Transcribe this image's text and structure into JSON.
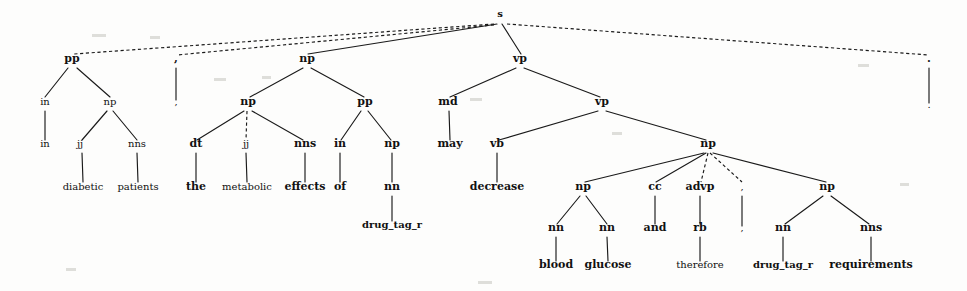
{
  "figure": {
    "name": "syntactic-parse-tree",
    "background_color": "#fdfdfc",
    "line_color": "#1a1a1a",
    "text_color": "#111111",
    "width": 967,
    "height": 291
  },
  "sentence": "in diabetic patients , the metabolic effects of drug_tag_r may decrease blood glucose and therefore , drug_tag_r requirements .",
  "nodes": [
    {
      "id": "s",
      "label": "s",
      "x": 500,
      "y": 17,
      "weight": "bold",
      "size": 10
    },
    {
      "id": "pp1",
      "label": "pp",
      "x": 72,
      "y": 62,
      "weight": "bold",
      "size": 11
    },
    {
      "id": "comma1",
      "label": ",",
      "x": 176,
      "y": 62,
      "weight": "bold",
      "size": 11
    },
    {
      "id": "np1",
      "label": "np",
      "x": 307,
      "y": 62,
      "weight": "bold",
      "size": 11
    },
    {
      "id": "vp1",
      "label": "vp",
      "x": 520,
      "y": 62,
      "weight": "bold",
      "size": 11
    },
    {
      "id": "period",
      "label": ".",
      "x": 929,
      "y": 62,
      "weight": "bold",
      "size": 11
    },
    {
      "id": "in1",
      "label": "in",
      "x": 45,
      "y": 105,
      "weight": "plain",
      "size": 10
    },
    {
      "id": "np2",
      "label": "np",
      "x": 110,
      "y": 105,
      "weight": "plain",
      "size": 10
    },
    {
      "id": "comma1t",
      "label": ",",
      "x": 176,
      "y": 105,
      "weight": "plain",
      "size": 10
    },
    {
      "id": "np3",
      "label": "np",
      "x": 248,
      "y": 105,
      "weight": "bold",
      "size": 11
    },
    {
      "id": "pp2",
      "label": "pp",
      "x": 365,
      "y": 105,
      "weight": "bold",
      "size": 11
    },
    {
      "id": "md",
      "label": "md",
      "x": 448,
      "y": 105,
      "weight": "bold",
      "size": 11
    },
    {
      "id": "vp2",
      "label": "vp",
      "x": 602,
      "y": 105,
      "weight": "bold",
      "size": 11
    },
    {
      "id": "periodt",
      "label": ".",
      "x": 929,
      "y": 108,
      "weight": "plain",
      "size": 10
    },
    {
      "id": "in1t",
      "label": "in",
      "x": 45,
      "y": 147,
      "weight": "plain",
      "size": 10
    },
    {
      "id": "jj1",
      "label": "jj",
      "x": 80,
      "y": 147,
      "weight": "plain",
      "size": 10
    },
    {
      "id": "nns1",
      "label": "nns",
      "x": 137,
      "y": 147,
      "weight": "plain",
      "size": 10
    },
    {
      "id": "dt",
      "label": "dt",
      "x": 196,
      "y": 147,
      "weight": "bold",
      "size": 11
    },
    {
      "id": "jj2",
      "label": "jj",
      "x": 246,
      "y": 147,
      "weight": "plain",
      "size": 10
    },
    {
      "id": "nns2",
      "label": "nns",
      "x": 305,
      "y": 147,
      "weight": "bold",
      "size": 11
    },
    {
      "id": "in2",
      "label": "in",
      "x": 340,
      "y": 147,
      "weight": "bold",
      "size": 11
    },
    {
      "id": "np4",
      "label": "np",
      "x": 392,
      "y": 147,
      "weight": "bold",
      "size": 11
    },
    {
      "id": "may",
      "label": "may",
      "x": 450,
      "y": 147,
      "weight": "bold",
      "size": 11
    },
    {
      "id": "vb",
      "label": "vb",
      "x": 497,
      "y": 147,
      "weight": "bold",
      "size": 11
    },
    {
      "id": "np5",
      "label": "np",
      "x": 708,
      "y": 147,
      "weight": "bold",
      "size": 11
    },
    {
      "id": "diabetic",
      "label": "diabetic",
      "x": 83,
      "y": 190,
      "weight": "plain",
      "size": 10
    },
    {
      "id": "patients",
      "label": "patients",
      "x": 138,
      "y": 190,
      "weight": "plain",
      "size": 10
    },
    {
      "id": "the",
      "label": "the",
      "x": 196,
      "y": 190,
      "weight": "bold",
      "size": 11
    },
    {
      "id": "metabolic",
      "label": "metabolic",
      "x": 247,
      "y": 190,
      "weight": "plain",
      "size": 10
    },
    {
      "id": "effects",
      "label": "effects",
      "x": 305,
      "y": 190,
      "weight": "bold",
      "size": 11
    },
    {
      "id": "of",
      "label": "of",
      "x": 340,
      "y": 190,
      "weight": "bold",
      "size": 11
    },
    {
      "id": "nn0",
      "label": "nn",
      "x": 392,
      "y": 190,
      "weight": "bold",
      "size": 11
    },
    {
      "id": "decrease",
      "label": "decrease",
      "x": 497,
      "y": 190,
      "weight": "bold",
      "size": 11
    },
    {
      "id": "np6",
      "label": "np",
      "x": 583,
      "y": 190,
      "weight": "bold",
      "size": 11
    },
    {
      "id": "cc",
      "label": "cc",
      "x": 655,
      "y": 190,
      "weight": "bold",
      "size": 11
    },
    {
      "id": "advp",
      "label": "advp",
      "x": 700,
      "y": 190,
      "weight": "bold",
      "size": 11
    },
    {
      "id": "comma2",
      "label": ",",
      "x": 742,
      "y": 190,
      "weight": "plain",
      "size": 10
    },
    {
      "id": "np7",
      "label": "np",
      "x": 827,
      "y": 190,
      "weight": "bold",
      "size": 11
    },
    {
      "id": "drug1",
      "label": "drug_tag_r",
      "x": 392,
      "y": 228,
      "weight": "bold",
      "size": 10
    },
    {
      "id": "nn1",
      "label": "nn",
      "x": 556,
      "y": 231,
      "weight": "bold",
      "size": 11
    },
    {
      "id": "nn2",
      "label": "nn",
      "x": 607,
      "y": 231,
      "weight": "bold",
      "size": 11
    },
    {
      "id": "and",
      "label": "and",
      "x": 655,
      "y": 231,
      "weight": "bold",
      "size": 11
    },
    {
      "id": "rb",
      "label": "rb",
      "x": 700,
      "y": 231,
      "weight": "bold",
      "size": 11
    },
    {
      "id": "comma2t",
      "label": ",",
      "x": 742,
      "y": 231,
      "weight": "plain",
      "size": 10
    },
    {
      "id": "nn3",
      "label": "nn",
      "x": 783,
      "y": 231,
      "weight": "bold",
      "size": 11
    },
    {
      "id": "nns3",
      "label": "nns",
      "x": 871,
      "y": 231,
      "weight": "bold",
      "size": 11
    },
    {
      "id": "blood",
      "label": "blood",
      "x": 556,
      "y": 268,
      "weight": "bold",
      "size": 11
    },
    {
      "id": "glucose",
      "label": "glucose",
      "x": 608,
      "y": 268,
      "weight": "bold",
      "size": 11
    },
    {
      "id": "therefore",
      "label": "therefore",
      "x": 700,
      "y": 268,
      "weight": "plain",
      "size": 10
    },
    {
      "id": "drug2",
      "label": "drug_tag_r",
      "x": 783,
      "y": 268,
      "weight": "bold",
      "size": 10
    },
    {
      "id": "reqs",
      "label": "requirements",
      "x": 871,
      "y": 268,
      "weight": "bold",
      "size": 11
    }
  ],
  "edges": [
    {
      "from": "s",
      "to": "pp1",
      "x1": 494,
      "y1": 24,
      "x2": 74,
      "y2": 54,
      "style": "dashed"
    },
    {
      "from": "s",
      "to": "comma1",
      "x1": 494,
      "y1": 25,
      "x2": 177,
      "y2": 55,
      "style": "dashed"
    },
    {
      "from": "s",
      "to": "np1",
      "x1": 497,
      "y1": 24,
      "x2": 308,
      "y2": 54,
      "style": "solid"
    },
    {
      "from": "s",
      "to": "vp1",
      "x1": 502,
      "y1": 24,
      "x2": 521,
      "y2": 54,
      "style": "solid"
    },
    {
      "from": "s",
      "to": "period",
      "x1": 507,
      "y1": 24,
      "x2": 929,
      "y2": 55,
      "style": "dashed"
    },
    {
      "from": "pp1",
      "to": "in1",
      "x1": 68,
      "y1": 68,
      "x2": 45,
      "y2": 97,
      "style": "solid"
    },
    {
      "from": "pp1",
      "to": "np2",
      "x1": 77,
      "y1": 68,
      "x2": 110,
      "y2": 97,
      "style": "solid"
    },
    {
      "from": "comma1",
      "to": "comma1t",
      "x1": 176,
      "y1": 68,
      "x2": 176,
      "y2": 100,
      "style": "solid"
    },
    {
      "from": "np1",
      "to": "np3",
      "x1": 303,
      "y1": 68,
      "x2": 250,
      "y2": 97,
      "style": "solid"
    },
    {
      "from": "np1",
      "to": "pp2",
      "x1": 311,
      "y1": 68,
      "x2": 364,
      "y2": 97,
      "style": "solid"
    },
    {
      "from": "vp1",
      "to": "md",
      "x1": 516,
      "y1": 68,
      "x2": 450,
      "y2": 97,
      "style": "solid"
    },
    {
      "from": "vp1",
      "to": "vp2",
      "x1": 524,
      "y1": 68,
      "x2": 600,
      "y2": 97,
      "style": "solid"
    },
    {
      "from": "period",
      "to": "periodt",
      "x1": 929,
      "y1": 68,
      "x2": 929,
      "y2": 103,
      "style": "solid"
    },
    {
      "from": "in1",
      "to": "in1t",
      "x1": 45,
      "y1": 111,
      "x2": 45,
      "y2": 140,
      "style": "solid"
    },
    {
      "from": "np2",
      "to": "jj1",
      "x1": 107,
      "y1": 111,
      "x2": 82,
      "y2": 140,
      "style": "solid"
    },
    {
      "from": "np2",
      "to": "nns1",
      "x1": 113,
      "y1": 111,
      "x2": 137,
      "y2": 140,
      "style": "solid"
    },
    {
      "from": "np3",
      "to": "dt",
      "x1": 244,
      "y1": 111,
      "x2": 197,
      "y2": 140,
      "style": "solid"
    },
    {
      "from": "np3",
      "to": "jj2",
      "x1": 247,
      "y1": 111,
      "x2": 246,
      "y2": 140,
      "style": "dashed"
    },
    {
      "from": "np3",
      "to": "nns2",
      "x1": 252,
      "y1": 111,
      "x2": 303,
      "y2": 140,
      "style": "solid"
    },
    {
      "from": "pp2",
      "to": "in2",
      "x1": 361,
      "y1": 111,
      "x2": 341,
      "y2": 140,
      "style": "solid"
    },
    {
      "from": "pp2",
      "to": "np4",
      "x1": 368,
      "y1": 111,
      "x2": 391,
      "y2": 140,
      "style": "solid"
    },
    {
      "from": "md",
      "to": "may",
      "x1": 449,
      "y1": 111,
      "x2": 450,
      "y2": 140,
      "style": "solid"
    },
    {
      "from": "vp2",
      "to": "vb",
      "x1": 598,
      "y1": 111,
      "x2": 499,
      "y2": 140,
      "style": "solid"
    },
    {
      "from": "vp2",
      "to": "np5",
      "x1": 606,
      "y1": 111,
      "x2": 706,
      "y2": 140,
      "style": "solid"
    },
    {
      "from": "jj1",
      "to": "diabetic",
      "x1": 82,
      "y1": 153,
      "x2": 83,
      "y2": 182,
      "style": "solid"
    },
    {
      "from": "nns1",
      "to": "patients",
      "x1": 137,
      "y1": 153,
      "x2": 138,
      "y2": 182,
      "style": "solid"
    },
    {
      "from": "dt",
      "to": "the",
      "x1": 196,
      "y1": 153,
      "x2": 196,
      "y2": 182,
      "style": "solid"
    },
    {
      "from": "jj2",
      "to": "metabolic",
      "x1": 246,
      "y1": 153,
      "x2": 247,
      "y2": 182,
      "style": "solid"
    },
    {
      "from": "nns2",
      "to": "effects",
      "x1": 305,
      "y1": 153,
      "x2": 305,
      "y2": 182,
      "style": "solid"
    },
    {
      "from": "in2",
      "to": "of",
      "x1": 340,
      "y1": 153,
      "x2": 340,
      "y2": 182,
      "style": "solid"
    },
    {
      "from": "np4",
      "to": "nn0",
      "x1": 392,
      "y1": 153,
      "x2": 392,
      "y2": 182,
      "style": "solid"
    },
    {
      "from": "vb",
      "to": "decrease",
      "x1": 497,
      "y1": 153,
      "x2": 497,
      "y2": 182,
      "style": "solid"
    },
    {
      "from": "np5",
      "to": "np6",
      "x1": 704,
      "y1": 153,
      "x2": 585,
      "y2": 182,
      "style": "solid"
    },
    {
      "from": "np5",
      "to": "cc",
      "x1": 706,
      "y1": 153,
      "x2": 656,
      "y2": 182,
      "style": "solid"
    },
    {
      "from": "np5",
      "to": "advp",
      "x1": 708,
      "y1": 153,
      "x2": 701,
      "y2": 182,
      "style": "dashed"
    },
    {
      "from": "np5",
      "to": "comma2",
      "x1": 710,
      "y1": 153,
      "x2": 742,
      "y2": 182,
      "style": "dashed"
    },
    {
      "from": "np5",
      "to": "np7",
      "x1": 713,
      "y1": 153,
      "x2": 826,
      "y2": 182,
      "style": "solid"
    },
    {
      "from": "nn0",
      "to": "drug1",
      "x1": 392,
      "y1": 196,
      "x2": 392,
      "y2": 221,
      "style": "solid"
    },
    {
      "from": "np6",
      "to": "nn1",
      "x1": 580,
      "y1": 196,
      "x2": 557,
      "y2": 224,
      "style": "solid"
    },
    {
      "from": "np6",
      "to": "nn2",
      "x1": 586,
      "y1": 196,
      "x2": 607,
      "y2": 224,
      "style": "solid"
    },
    {
      "from": "cc",
      "to": "and",
      "x1": 655,
      "y1": 196,
      "x2": 655,
      "y2": 224,
      "style": "solid"
    },
    {
      "from": "advp",
      "to": "rb",
      "x1": 700,
      "y1": 196,
      "x2": 700,
      "y2": 224,
      "style": "solid"
    },
    {
      "from": "comma2",
      "to": "comma2t",
      "x1": 742,
      "y1": 196,
      "x2": 742,
      "y2": 226,
      "style": "solid"
    },
    {
      "from": "np7",
      "to": "nn3",
      "x1": 823,
      "y1": 196,
      "x2": 785,
      "y2": 224,
      "style": "solid"
    },
    {
      "from": "np7",
      "to": "nns3",
      "x1": 831,
      "y1": 196,
      "x2": 869,
      "y2": 224,
      "style": "solid"
    },
    {
      "from": "nn1",
      "to": "blood",
      "x1": 556,
      "y1": 237,
      "x2": 556,
      "y2": 261,
      "style": "solid"
    },
    {
      "from": "nn2",
      "to": "glucose",
      "x1": 607,
      "y1": 237,
      "x2": 608,
      "y2": 261,
      "style": "solid"
    },
    {
      "from": "rb",
      "to": "therefore",
      "x1": 700,
      "y1": 237,
      "x2": 700,
      "y2": 261,
      "style": "solid"
    },
    {
      "from": "nn3",
      "to": "drug2",
      "x1": 783,
      "y1": 237,
      "x2": 783,
      "y2": 261,
      "style": "solid"
    },
    {
      "from": "nns3",
      "to": "reqs",
      "x1": 871,
      "y1": 237,
      "x2": 871,
      "y2": 261,
      "style": "solid"
    }
  ],
  "specks": [
    {
      "x": 92,
      "y": 34,
      "w": 14,
      "h": 3
    },
    {
      "x": 150,
      "y": 36,
      "w": 10,
      "h": 3
    },
    {
      "x": 214,
      "y": 78,
      "w": 12,
      "h": 3
    },
    {
      "x": 262,
      "y": 76,
      "w": 9,
      "h": 3
    },
    {
      "x": 470,
      "y": 98,
      "w": 12,
      "h": 3
    },
    {
      "x": 612,
      "y": 132,
      "w": 10,
      "h": 3
    },
    {
      "x": 858,
      "y": 64,
      "w": 11,
      "h": 3
    },
    {
      "x": 900,
      "y": 183,
      "w": 9,
      "h": 3
    },
    {
      "x": 66,
      "y": 268,
      "w": 10,
      "h": 3
    },
    {
      "x": 478,
      "y": 281,
      "w": 14,
      "h": 3
    }
  ]
}
